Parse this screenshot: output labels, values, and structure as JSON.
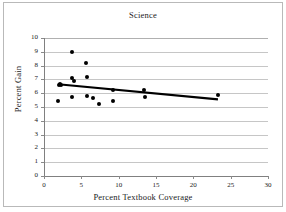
{
  "chart_data": {
    "type": "scatter",
    "title": "Science",
    "xlabel": "Percent Textbook Coverage",
    "ylabel": "Percent Gain",
    "xlim": [
      0,
      30
    ],
    "ylim": [
      0,
      10
    ],
    "xticks": [
      0,
      5,
      10,
      15,
      20,
      25,
      30
    ],
    "yticks": [
      0,
      1,
      2,
      3,
      4,
      5,
      6,
      7,
      8,
      9,
      10
    ],
    "grid": "horizontal",
    "legend": "none",
    "marker": "filled-circle",
    "marker_color": "#000000",
    "points": [
      {
        "x": 1.9,
        "y": 5.4
      },
      {
        "x": 2.0,
        "y": 6.6
      },
      {
        "x": 2.1,
        "y": 6.7
      },
      {
        "x": 2.3,
        "y": 6.6
      },
      {
        "x": 3.7,
        "y": 9.0
      },
      {
        "x": 3.7,
        "y": 7.1
      },
      {
        "x": 3.8,
        "y": 5.7
      },
      {
        "x": 4.0,
        "y": 6.9
      },
      {
        "x": 5.6,
        "y": 8.2
      },
      {
        "x": 5.7,
        "y": 7.15
      },
      {
        "x": 5.8,
        "y": 5.8
      },
      {
        "x": 6.5,
        "y": 5.65
      },
      {
        "x": 7.4,
        "y": 5.25
      },
      {
        "x": 9.2,
        "y": 6.25
      },
      {
        "x": 9.3,
        "y": 5.45
      },
      {
        "x": 13.4,
        "y": 6.2
      },
      {
        "x": 13.5,
        "y": 5.75
      },
      {
        "x": 23.3,
        "y": 5.85
      }
    ],
    "trendline": {
      "type": "linear",
      "x_start": 1.9,
      "y_start": 6.65,
      "x_end": 23.3,
      "y_end": 5.55,
      "color": "#000000"
    }
  },
  "figure": {
    "background_color": "#ffffff",
    "border_color": "#b9b9b9"
  }
}
